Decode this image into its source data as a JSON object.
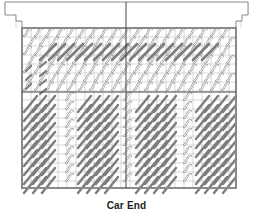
{
  "diagram": {
    "type": "needlepoint-stitch-chart",
    "caption": "Car End",
    "colors": {
      "grid_line": "#bdbdbd",
      "border": "#8a8a8a",
      "center_line": "#444444",
      "light_stitch_fill": "#ffffff",
      "light_stitch_stroke": "#9a9a9a",
      "dark_stitch": "#7d7d7d"
    },
    "grid": {
      "cell": 9,
      "main_left": 22,
      "main_top": 28,
      "main_right": 236,
      "main_bottom": 188,
      "center_x": 126,
      "center_y": 92
    }
  }
}
